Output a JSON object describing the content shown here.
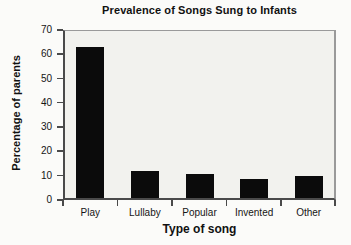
{
  "chart_data": {
    "type": "bar",
    "title": "Prevalence of Songs Sung to Infants",
    "xlabel": "Type of song",
    "ylabel": "Percentage of parents",
    "categories": [
      "Play",
      "Lullaby",
      "Popular",
      "Invented",
      "Other"
    ],
    "values": [
      62,
      11,
      10,
      8,
      9
    ],
    "ylim": [
      0,
      70
    ],
    "yticks": [
      0,
      10,
      20,
      30,
      40,
      50,
      60,
      70
    ],
    "grid": false,
    "legend": false,
    "bar_color": "#0b0b0b",
    "axis_color": "#4a4a4a",
    "frame_color": "#9a9a9a",
    "plot_background": "#f2f2ee",
    "figure_background": "#fbfbf9",
    "text_color": "#111111"
  }
}
